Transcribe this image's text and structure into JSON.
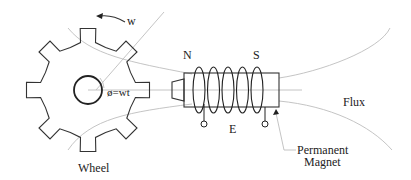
{
  "diagram": {
    "labels": {
      "rotation": "w",
      "angle": "ø=wt",
      "north_pole": "N",
      "south_pole": "S",
      "output_voltage": "E",
      "flux": "Flux",
      "wheel": "Wheel",
      "magnet_line1": "Permanent",
      "magnet_line2": "Magnet"
    },
    "wheel": {
      "teeth": 8
    },
    "coil": {
      "turns": 5
    },
    "colors": {
      "line": "#333333",
      "flux_line": "#bdbdbd",
      "text": "#222222",
      "background": "#ffffff"
    }
  }
}
